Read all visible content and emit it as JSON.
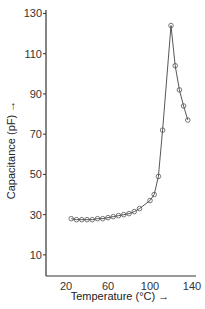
{
  "chart_data": {
    "type": "line",
    "title": "",
    "xlabel": "Temperature (°C) →",
    "ylabel": "Capacitance (pF) →",
    "xlim": [
      5,
      145
    ],
    "ylim": [
      0,
      132
    ],
    "x_ticks": [
      20,
      60,
      100,
      140
    ],
    "y_ticks": [
      10,
      30,
      50,
      70,
      90,
      110,
      130
    ],
    "grid": false,
    "legend": null,
    "marker": "circle",
    "series": [
      {
        "name": "Capacitance",
        "x": [
          25,
          30,
          35,
          40,
          45,
          50,
          55,
          60,
          65,
          70,
          75,
          80,
          85,
          90,
          100,
          104,
          108,
          112,
          120,
          124,
          128,
          132,
          136
        ],
        "values": [
          28,
          27.5,
          27.5,
          27.5,
          27.5,
          28,
          28,
          28.5,
          29,
          29.5,
          30,
          30.5,
          31.5,
          33,
          37,
          40,
          49,
          72,
          124,
          104,
          92,
          84,
          77
        ]
      }
    ]
  }
}
